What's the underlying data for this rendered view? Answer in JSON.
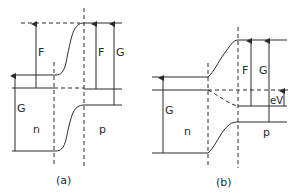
{
  "diagram": {
    "type": "pn-junction band diagram",
    "panels": [
      {
        "caption": "(a)",
        "labels": {
          "gap_left": "G",
          "fermi_left": "F",
          "fermi_right": "F",
          "gap_right": "G",
          "n_region": "n",
          "p_region": "p"
        }
      },
      {
        "caption": "(b)",
        "labels": {
          "gap_left": "G",
          "fermi_right": "F",
          "gap_right": "G",
          "bias": "eV",
          "n_region": "n",
          "p_region": "p"
        }
      }
    ],
    "colors": {
      "line": "#2a2a2a",
      "background": "#ffffff"
    }
  }
}
